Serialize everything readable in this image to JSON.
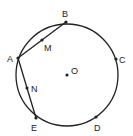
{
  "diagram": {
    "circle": {
      "cx": 67,
      "cy": 75,
      "r": 51,
      "stroke": "#222"
    },
    "points": [
      {
        "label": "B",
        "x": 66,
        "y": 22,
        "lx": 62,
        "ly": 17
      },
      {
        "label": "C",
        "x": 116,
        "y": 59,
        "lx": 119,
        "ly": 63
      },
      {
        "label": "D",
        "x": 96,
        "y": 117,
        "lx": 94,
        "ly": 131
      },
      {
        "label": "E",
        "x": 36,
        "y": 118,
        "lx": 31,
        "ly": 131
      },
      {
        "label": "A",
        "x": 18,
        "y": 58,
        "lx": 7,
        "ly": 62
      },
      {
        "label": "M",
        "x": 42,
        "y": 40,
        "lx": 44,
        "ly": 51
      },
      {
        "label": "N",
        "x": 27,
        "y": 88,
        "lx": 31,
        "ly": 92
      },
      {
        "label": "O",
        "x": 67,
        "y": 75,
        "lx": 71,
        "ly": 74
      }
    ],
    "segments": [
      [
        "A",
        "B"
      ],
      [
        "A",
        "E"
      ]
    ]
  }
}
